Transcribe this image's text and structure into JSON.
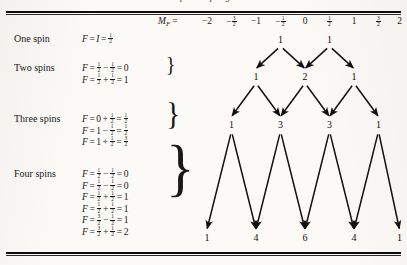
{
  "figure": {
    "cropped_caption_above_rule": "spin coupling",
    "header": {
      "symbol": "M",
      "subscript": "F",
      "equals": "=",
      "values": [
        {
          "text": "-2",
          "num": null,
          "den": null,
          "sign": ""
        },
        {
          "text": "",
          "num": "3",
          "den": "2",
          "sign": "−"
        },
        {
          "text": "-1",
          "num": null,
          "den": null,
          "sign": ""
        },
        {
          "text": "",
          "num": "1",
          "den": "2",
          "sign": "−"
        },
        {
          "text": "0",
          "num": null,
          "den": null,
          "sign": ""
        },
        {
          "text": "",
          "num": "1",
          "den": "2",
          "sign": ""
        },
        {
          "text": "1",
          "num": null,
          "den": null,
          "sign": ""
        },
        {
          "text": "",
          "num": "3",
          "den": "2",
          "sign": ""
        },
        {
          "text": "2",
          "num": null,
          "den": null,
          "sign": ""
        }
      ]
    },
    "rows": [
      {
        "label": "One spin",
        "equations": [
          {
            "parts": [
              {
                "t": "var",
                "v": "F"
              },
              {
                "t": "op",
                "v": "="
              },
              {
                "t": "var",
                "v": "I"
              },
              {
                "t": "op",
                "v": "="
              },
              {
                "t": "frac",
                "n": "1",
                "d": "2"
              }
            ]
          }
        ],
        "brace": false
      },
      {
        "label": "Two spins",
        "equations": [
          {
            "parts": [
              {
                "t": "var",
                "v": "F"
              },
              {
                "t": "op",
                "v": "="
              },
              {
                "t": "frac",
                "n": "1",
                "d": "2"
              },
              {
                "t": "op",
                "v": "−"
              },
              {
                "t": "frac",
                "n": "1",
                "d": "2"
              },
              {
                "t": "op",
                "v": "="
              },
              {
                "t": "txt",
                "v": "0"
              }
            ]
          },
          {
            "parts": [
              {
                "t": "var",
                "v": "F"
              },
              {
                "t": "op",
                "v": "="
              },
              {
                "t": "frac",
                "n": "1",
                "d": "2"
              },
              {
                "t": "op",
                "v": "+"
              },
              {
                "t": "frac",
                "n": "1",
                "d": "2"
              },
              {
                "t": "op",
                "v": "="
              },
              {
                "t": "txt",
                "v": "1"
              }
            ]
          }
        ],
        "brace": true
      },
      {
        "label": "Three spins",
        "equations": [
          {
            "parts": [
              {
                "t": "var",
                "v": "F"
              },
              {
                "t": "op",
                "v": "="
              },
              {
                "t": "txt",
                "v": "0"
              },
              {
                "t": "op",
                "v": "+"
              },
              {
                "t": "frac",
                "n": "1",
                "d": "2"
              },
              {
                "t": "op",
                "v": "="
              },
              {
                "t": "frac",
                "n": "1",
                "d": "2"
              }
            ]
          },
          {
            "parts": [
              {
                "t": "var",
                "v": "F"
              },
              {
                "t": "op",
                "v": "="
              },
              {
                "t": "txt",
                "v": "1"
              },
              {
                "t": "op",
                "v": "−"
              },
              {
                "t": "frac",
                "n": "1",
                "d": "2"
              },
              {
                "t": "op",
                "v": "="
              },
              {
                "t": "frac",
                "n": "1",
                "d": "2"
              }
            ]
          },
          {
            "parts": [
              {
                "t": "var",
                "v": "F"
              },
              {
                "t": "op",
                "v": "="
              },
              {
                "t": "txt",
                "v": "1"
              },
              {
                "t": "op",
                "v": "+"
              },
              {
                "t": "frac",
                "n": "1",
                "d": "2"
              },
              {
                "t": "op",
                "v": "="
              },
              {
                "t": "frac",
                "n": "3",
                "d": "2"
              }
            ]
          }
        ],
        "brace": true
      },
      {
        "label": "Four spins",
        "equations": [
          {
            "parts": [
              {
                "t": "var",
                "v": "F"
              },
              {
                "t": "op",
                "v": "="
              },
              {
                "t": "frac",
                "n": "1",
                "d": "2"
              },
              {
                "t": "op",
                "v": "−"
              },
              {
                "t": "frac",
                "n": "1",
                "d": "2"
              },
              {
                "t": "op",
                "v": "="
              },
              {
                "t": "txt",
                "v": "0"
              }
            ]
          },
          {
            "parts": [
              {
                "t": "var",
                "v": "F"
              },
              {
                "t": "op",
                "v": "="
              },
              {
                "t": "frac",
                "n": "1",
                "d": "2"
              },
              {
                "t": "op",
                "v": "−"
              },
              {
                "t": "frac",
                "n": "1",
                "d": "2"
              },
              {
                "t": "op",
                "v": "="
              },
              {
                "t": "txt",
                "v": "0"
              }
            ]
          },
          {
            "parts": [
              {
                "t": "var",
                "v": "F"
              },
              {
                "t": "op",
                "v": "="
              },
              {
                "t": "frac",
                "n": "1",
                "d": "2"
              },
              {
                "t": "op",
                "v": "+"
              },
              {
                "t": "frac",
                "n": "1",
                "d": "2"
              },
              {
                "t": "op",
                "v": "="
              },
              {
                "t": "txt",
                "v": "1"
              }
            ]
          },
          {
            "parts": [
              {
                "t": "var",
                "v": "F"
              },
              {
                "t": "op",
                "v": "="
              },
              {
                "t": "frac",
                "n": "1",
                "d": "2"
              },
              {
                "t": "op",
                "v": "+"
              },
              {
                "t": "frac",
                "n": "1",
                "d": "2"
              },
              {
                "t": "op",
                "v": "="
              },
              {
                "t": "txt",
                "v": "1"
              }
            ]
          },
          {
            "parts": [
              {
                "t": "var",
                "v": "F"
              },
              {
                "t": "op",
                "v": "="
              },
              {
                "t": "frac",
                "n": "3",
                "d": "2"
              },
              {
                "t": "op",
                "v": "−"
              },
              {
                "t": "frac",
                "n": "1",
                "d": "2"
              },
              {
                "t": "op",
                "v": "="
              },
              {
                "t": "txt",
                "v": "1"
              }
            ]
          },
          {
            "parts": [
              {
                "t": "var",
                "v": "F"
              },
              {
                "t": "op",
                "v": "="
              },
              {
                "t": "frac",
                "n": "3",
                "d": "2"
              },
              {
                "t": "op",
                "v": "+"
              },
              {
                "t": "frac",
                "n": "1",
                "d": "2"
              },
              {
                "t": "op",
                "v": "="
              },
              {
                "t": "txt",
                "v": "2"
              }
            ]
          }
        ],
        "brace": true
      }
    ]
  },
  "chart_data": {
    "type": "diagram",
    "xlabel": "M_F",
    "x_tick_labels": [
      "-2",
      "-3/2",
      "-1",
      "-1/2",
      "0",
      "1/2",
      "1",
      "3/2",
      "2"
    ],
    "x_tick_values": [
      -2,
      -1.5,
      -1,
      -0.5,
      0,
      0.5,
      1,
      1.5,
      2
    ],
    "row_labels": [
      "One spin",
      "Two spins",
      "Three spins",
      "Four spins"
    ],
    "levels": [
      {
        "row": "One spin",
        "mf": [
          -0.5,
          0.5
        ],
        "intensities": [
          1,
          1
        ]
      },
      {
        "row": "Two spins",
        "mf": [
          -1,
          0,
          1
        ],
        "intensities": [
          1,
          2,
          1
        ]
      },
      {
        "row": "Three spins",
        "mf": [
          -1.5,
          -0.5,
          0.5,
          1.5
        ],
        "intensities": [
          1,
          3,
          3,
          1
        ]
      },
      {
        "row": "Four spins",
        "mf": [
          -2,
          -1,
          0,
          1,
          2
        ],
        "intensities": [
          1,
          4,
          6,
          4,
          1
        ]
      }
    ],
    "arrows_description": "Each node branches with two downward arrows to the adjacent M_F columns one level below",
    "grid": false,
    "legend": false
  },
  "colors": {
    "ink": "#111111",
    "paper": "#fbfaf6",
    "rule": "#0d0d0d"
  }
}
